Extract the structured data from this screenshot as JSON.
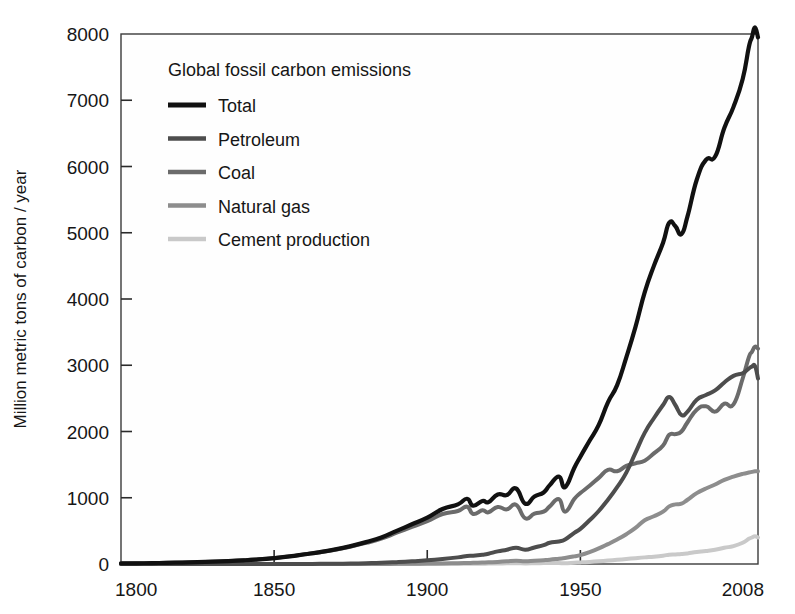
{
  "figure": {
    "background_color": "#ffffff",
    "plot_background_color": "#fefefe",
    "frame_color": "#3b3b3b"
  },
  "chart_data": {
    "type": "line",
    "title": "Global fossil carbon emissions",
    "subtitle": "",
    "xlabel": "",
    "ylabel": "Million metric tons of carbon / year",
    "xlim": [
      1800,
      2008
    ],
    "ylim": [
      0,
      8000
    ],
    "grid": false,
    "legend_position": "upper-left-inside",
    "x_tick_labels": [
      "1800",
      "1850",
      "1900",
      "1950",
      "2008"
    ],
    "x_ticks": [
      1800,
      1850,
      1900,
      1950,
      2008
    ],
    "y_tick_labels": [
      "0",
      "1000",
      "2000",
      "3000",
      "4000",
      "5000",
      "6000",
      "7000",
      "8000"
    ],
    "y_ticks": [
      0,
      1000,
      2000,
      3000,
      4000,
      5000,
      6000,
      7000,
      8000
    ],
    "x": [
      1800,
      1805,
      1810,
      1815,
      1820,
      1825,
      1830,
      1835,
      1840,
      1845,
      1850,
      1855,
      1860,
      1865,
      1870,
      1875,
      1880,
      1885,
      1890,
      1895,
      1900,
      1905,
      1910,
      1913,
      1915,
      1918,
      1920,
      1923,
      1926,
      1929,
      1932,
      1935,
      1938,
      1940,
      1943,
      1945,
      1948,
      1950,
      1953,
      1956,
      1959,
      1962,
      1965,
      1968,
      1971,
      1974,
      1977,
      1979,
      1981,
      1983,
      1985,
      1988,
      1991,
      1994,
      1997,
      2000,
      2003,
      2005,
      2006,
      2007,
      2008
    ],
    "series": [
      {
        "name": "Total",
        "color": "#111111",
        "linewidth": 4.2,
        "values": [
          8,
          10,
          13,
          17,
          22,
          28,
          35,
          44,
          55,
          70,
          90,
          115,
          147,
          180,
          220,
          270,
          330,
          400,
          500,
          600,
          700,
          830,
          900,
          985,
          880,
          950,
          935,
          1050,
          1040,
          1140,
          910,
          1020,
          1080,
          1190,
          1320,
          1160,
          1450,
          1620,
          1860,
          2100,
          2440,
          2700,
          3120,
          3580,
          4100,
          4500,
          4850,
          5150,
          5100,
          4980,
          5250,
          5800,
          6100,
          6150,
          6580,
          6900,
          7320,
          7800,
          7950,
          8100,
          7950
        ]
      },
      {
        "name": "Petroleum",
        "color": "#4d4d4d",
        "linewidth": 4.0,
        "values": [
          0,
          0,
          0,
          0,
          0,
          0,
          0,
          0,
          0,
          0,
          0,
          0,
          1,
          2,
          4,
          7,
          12,
          18,
          28,
          40,
          55,
          75,
          100,
          120,
          125,
          140,
          155,
          190,
          215,
          245,
          215,
          250,
          285,
          320,
          340,
          370,
          470,
          530,
          660,
          800,
          970,
          1160,
          1380,
          1680,
          1980,
          2200,
          2400,
          2520,
          2400,
          2250,
          2300,
          2480,
          2550,
          2620,
          2740,
          2840,
          2880,
          2950,
          2980,
          2990,
          2800
        ]
      },
      {
        "name": "Coal",
        "color": "#6b6b6b",
        "linewidth": 4.0,
        "values": [
          8,
          10,
          13,
          17,
          22,
          28,
          35,
          44,
          55,
          70,
          90,
          115,
          146,
          178,
          216,
          263,
          318,
          382,
          472,
          560,
          645,
          755,
          800,
          865,
          755,
          810,
          780,
          860,
          825,
          895,
          690,
          760,
          790,
          870,
          980,
          790,
          980,
          1070,
          1180,
          1300,
          1420,
          1400,
          1480,
          1520,
          1560,
          1670,
          1790,
          1950,
          1960,
          2000,
          2140,
          2330,
          2380,
          2300,
          2420,
          2410,
          2800,
          3120,
          3200,
          3280,
          3250
        ]
      },
      {
        "name": "Natural gas",
        "color": "#8d8d8d",
        "linewidth": 4.0,
        "values": [
          0,
          0,
          0,
          0,
          0,
          0,
          0,
          0,
          0,
          0,
          0,
          0,
          0,
          0,
          0,
          0,
          0,
          1,
          2,
          4,
          6,
          9,
          13,
          16,
          18,
          22,
          25,
          32,
          40,
          48,
          42,
          50,
          58,
          65,
          80,
          90,
          115,
          135,
          180,
          235,
          300,
          370,
          450,
          545,
          660,
          720,
          790,
          870,
          900,
          910,
          970,
          1070,
          1140,
          1200,
          1270,
          1320,
          1360,
          1380,
          1390,
          1400,
          1400
        ]
      },
      {
        "name": "Cement production",
        "color": "#c9c9c9",
        "linewidth": 4.0,
        "values": [
          0,
          0,
          0,
          0,
          0,
          0,
          0,
          0,
          0,
          0,
          0,
          0,
          0,
          0,
          0,
          0,
          0,
          0,
          0,
          0,
          1,
          2,
          3,
          4,
          4,
          5,
          6,
          8,
          10,
          12,
          9,
          11,
          14,
          16,
          15,
          12,
          20,
          24,
          32,
          42,
          52,
          63,
          75,
          88,
          100,
          110,
          125,
          140,
          145,
          150,
          160,
          180,
          195,
          215,
          245,
          270,
          320,
          380,
          400,
          420,
          400
        ]
      }
    ]
  },
  "legend": {
    "title": "Global fossil carbon emissions",
    "entries": [
      {
        "label": "Total",
        "color": "#111111"
      },
      {
        "label": "Petroleum",
        "color": "#4d4d4d"
      },
      {
        "label": "Coal",
        "color": "#6b6b6b"
      },
      {
        "label": "Natural gas",
        "color": "#8d8d8d"
      },
      {
        "label": "Cement production",
        "color": "#c9c9c9"
      }
    ]
  }
}
